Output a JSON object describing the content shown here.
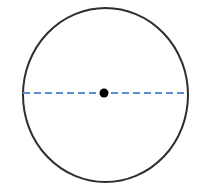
{
  "figure": {
    "name": "circle-with-diameter",
    "width": 206,
    "height": 193,
    "background_color": "#ffffff",
    "labels": []
  },
  "chart_data": {
    "type": "diagram",
    "title": "",
    "subtitle": "",
    "xlabel": "",
    "ylabel": "",
    "grid": false,
    "legend": false,
    "shapes": [
      {
        "name": "circle-outline",
        "kind": "ellipse",
        "cx": 105.5,
        "cy": 95,
        "rx": 82.5,
        "ry": 87,
        "stroke_color": "#2e2e2e",
        "stroke_width": 2,
        "fill": "none",
        "dashed": false
      },
      {
        "name": "diameter-line",
        "kind": "line",
        "x1": 23,
        "y1": 93,
        "x2": 188,
        "y2": 93,
        "stroke_color": "#5b8fd4",
        "stroke_width": 2,
        "fill": "none",
        "dashed": true,
        "dash_length": 7,
        "gap_length": 4
      },
      {
        "name": "center-point-dot",
        "kind": "circle",
        "cx": 104,
        "cy": 93,
        "r": 4.5,
        "stroke_color": "#000000",
        "stroke_width": 0,
        "fill": "#000000",
        "dashed": false
      }
    ]
  }
}
